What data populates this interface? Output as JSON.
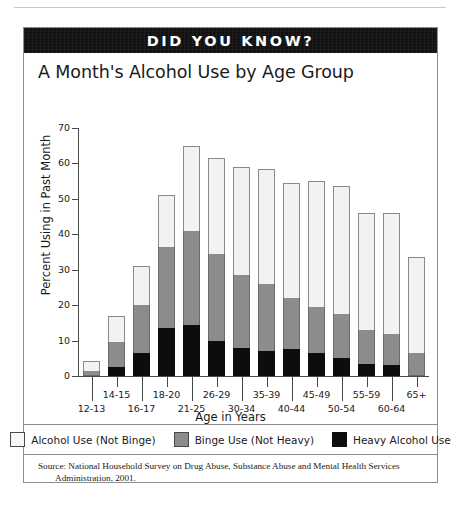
{
  "page_header": {
    "text": "",
    "note": "faint cropped running head"
  },
  "banner": {
    "label": "DID YOU KNOW?"
  },
  "chart_data": {
    "type": "bar",
    "subtype": "stacked-bar",
    "title": "A Month's Alcohol Use by Age Group",
    "xlabel": "Age in Years",
    "ylabel": "Percent Using in Past Month",
    "ylim": [
      0,
      70
    ],
    "ytick_values": [
      0,
      10,
      20,
      30,
      40,
      50,
      60,
      70
    ],
    "ytick_labels": [
      "0",
      "10",
      "20",
      "30",
      "40",
      "50",
      "60",
      "70"
    ],
    "grid": false,
    "legend_position": "bottom",
    "categories": [
      "12-13",
      "14-15",
      "16-17",
      "18-20",
      "21-25",
      "26-29",
      "30-34",
      "35-39",
      "40-44",
      "45-49",
      "50-54",
      "55-59",
      "60-64",
      "65+"
    ],
    "series": [
      {
        "name": "Heavy Alcohol Use",
        "color": "#0d0d0d",
        "values": [
          0.0,
          2.5,
          6.5,
          13.5,
          14.5,
          10.0,
          8.0,
          7.0,
          7.5,
          6.5,
          5.0,
          3.5,
          3.0,
          0.0
        ]
      },
      {
        "name": "Binge Use (Not Heavy)",
        "color": "#8c8c8c",
        "values": [
          1.5,
          7.0,
          13.5,
          23.0,
          26.5,
          24.5,
          20.5,
          19.0,
          14.5,
          13.0,
          12.5,
          9.5,
          9.0,
          6.5
        ]
      },
      {
        "name": "Alcohol Use (Not Binge)",
        "color": "#f2f2f2",
        "values": [
          2.8,
          7.5,
          11.0,
          14.5,
          24.0,
          27.0,
          30.5,
          32.5,
          32.5,
          35.5,
          36.0,
          33.0,
          34.0,
          27.0
        ]
      }
    ],
    "totals": [
      4.3,
      17.0,
      31.0,
      51.0,
      65.0,
      61.5,
      59.0,
      58.5,
      54.5,
      55.0,
      53.5,
      46.0,
      46.0,
      33.5
    ]
  },
  "legend": {
    "items": [
      {
        "label": "Alcohol Use (Not Binge)",
        "swatch": "white"
      },
      {
        "label": "Binge Use (Not Heavy)",
        "swatch": "gray"
      },
      {
        "label": "Heavy Alcohol Use",
        "swatch": "black"
      }
    ]
  },
  "source": {
    "line1": "Source:  National Household Survey on Drug Abuse, Substance Abuse and Mental Health Services",
    "line2": "Administration, 2001."
  }
}
